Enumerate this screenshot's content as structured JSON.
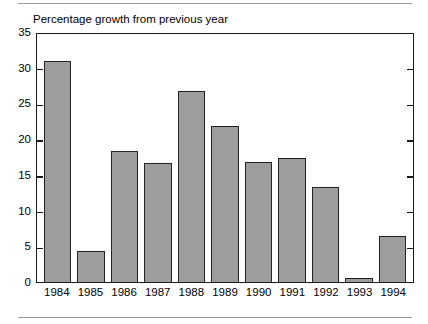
{
  "chart_data": {
    "type": "bar",
    "title": "Percentage growth from previous year",
    "xlabel": "",
    "ylabel": "",
    "ylim": [
      0,
      35
    ],
    "yticks": [
      0,
      5,
      10,
      15,
      20,
      25,
      30,
      35
    ],
    "ytick_labels": [
      "0",
      "5",
      "10",
      "15",
      "20",
      "25",
      "30",
      "35"
    ],
    "grid": false,
    "legend": null,
    "categories": [
      "1984",
      "1985",
      "1986",
      "1987",
      "1988",
      "1989",
      "1990",
      "1991",
      "1992",
      "1993",
      "1994"
    ],
    "values": [
      31.0,
      4.3,
      18.3,
      16.7,
      26.7,
      21.9,
      16.8,
      17.3,
      13.3,
      0.6,
      6.4
    ],
    "bar_color": "#9d9d9d",
    "bar_edge_color": "#232323",
    "axis_color": "#1a1a1a"
  },
  "decor": {
    "rule_color": "#9a9a9a"
  }
}
